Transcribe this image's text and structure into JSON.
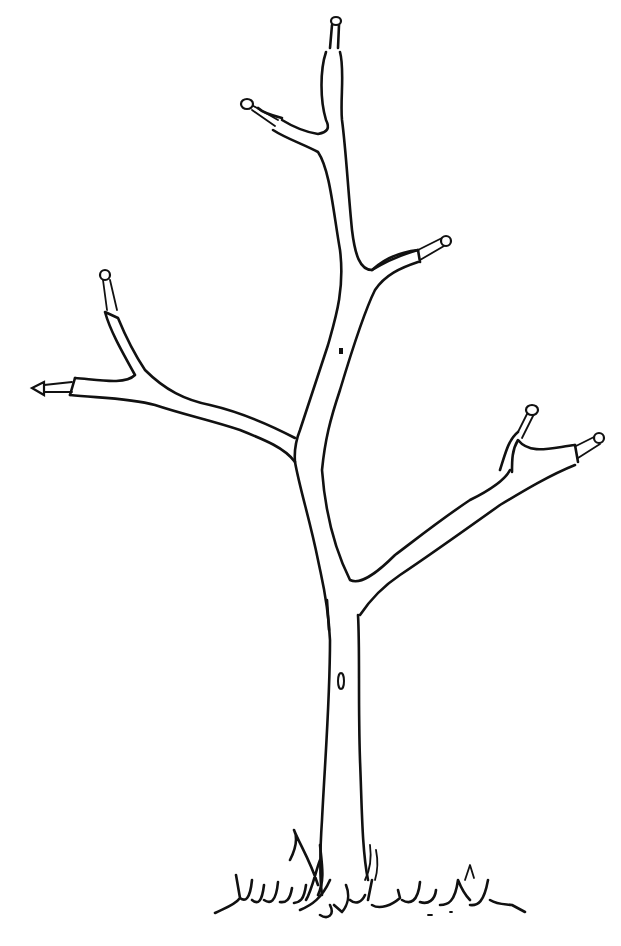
{
  "image": {
    "subject": "Line drawing of a young pruned tree with cut branch tips",
    "background": "#ffffff",
    "ink_color": "#111111",
    "cut_tips_count": 7
  }
}
